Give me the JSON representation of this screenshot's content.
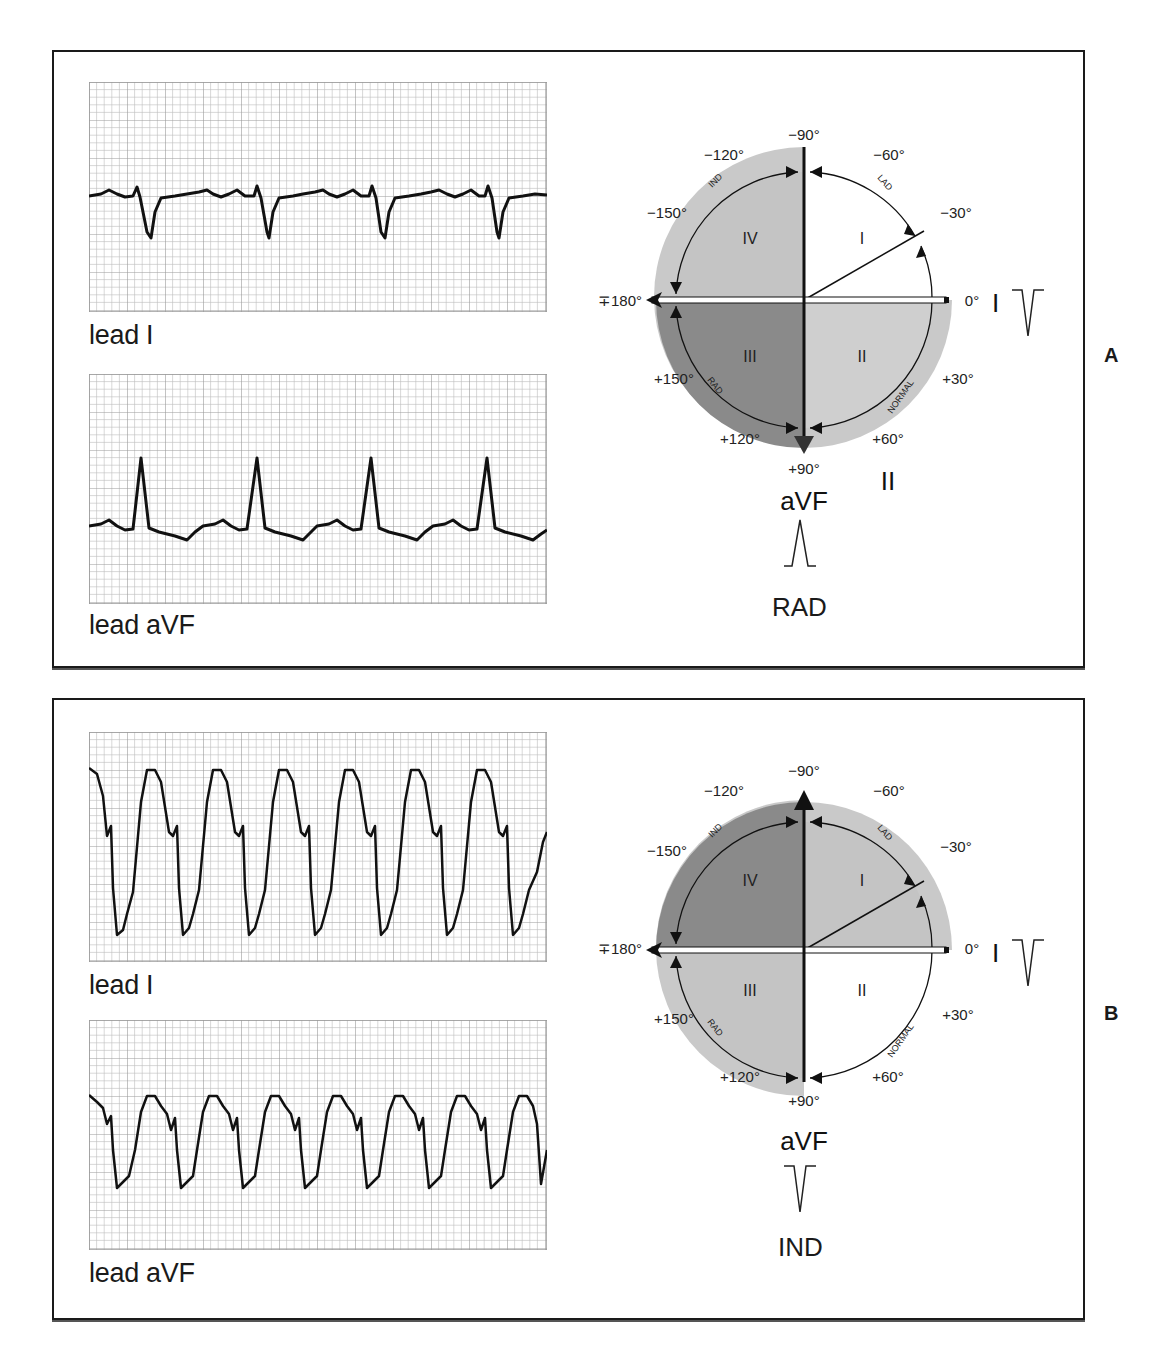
{
  "figure": {
    "panels": [
      {
        "id": "A",
        "letter": "A",
        "strips": [
          {
            "label": "lead I",
            "morphology": "negative QRS (small r, deep S)",
            "beats": 4
          },
          {
            "label": "lead aVF",
            "morphology": "positive QRS (tall R)",
            "beats": 4
          }
        ],
        "wheel": {
          "angle_labels": {
            "m90": "−90°",
            "m120": "−120°",
            "m60": "−60°",
            "m150": "−150°",
            "m30": "−30°",
            "p180": "∓180°",
            "zero": "0°",
            "p150": "+150°",
            "p30": "+30°",
            "p120": "+120°",
            "p60": "+60°",
            "p90": "+90°"
          },
          "quadrants": {
            "q1": "I",
            "q2": "II",
            "q3": "III",
            "q4": "IV"
          },
          "arc_labels": {
            "ind": "IND",
            "lad": "LAD",
            "rad": "RAD",
            "normal": "NORMAL"
          },
          "axis_lead_horizontal": "I",
          "axis_lead_vertical": "aVF",
          "lead_ii_label": "II",
          "highlighted_quadrant": "III",
          "colors": {
            "outer_ring": "#c9c9c9",
            "q1": "#ffffff",
            "q2": "#cfcfcf",
            "q3": "#8a8a8a",
            "q4": "#c4c4c4"
          }
        },
        "lead_I_glyph": "negative deflection",
        "aVF_glyph": "positive deflection",
        "result": "RAD"
      },
      {
        "id": "B",
        "letter": "B",
        "strips": [
          {
            "label": "lead I",
            "morphology": "wide negative complexes",
            "beats": 9
          },
          {
            "label": "lead aVF",
            "morphology": "wide negative complexes",
            "beats": 9
          }
        ],
        "wheel": {
          "angle_labels": {
            "m90": "−90°",
            "m120": "−120°",
            "m60": "−60°",
            "m150": "−150°",
            "m30": "−30°",
            "p180": "∓180°",
            "zero": "0°",
            "p150": "+150°",
            "p30": "+30°",
            "p120": "+120°",
            "p60": "+60°",
            "p90": "+90°"
          },
          "quadrants": {
            "q1": "I",
            "q2": "II",
            "q3": "III",
            "q4": "IV"
          },
          "arc_labels": {
            "ind": "IND",
            "lad": "LAD",
            "rad": "RAD",
            "normal": "NORMAL"
          },
          "axis_lead_horizontal": "I",
          "axis_lead_vertical": "aVF",
          "highlighted_quadrant": "IV",
          "colors": {
            "outer_ring": "#c9c9c9",
            "q1": "#c4c4c4",
            "q2": "#ffffff",
            "q3": "#c4c4c4",
            "q4": "#8a8a8a"
          }
        },
        "lead_I_glyph": "negative deflection",
        "aVF_glyph": "negative deflection",
        "result": "IND"
      }
    ]
  }
}
